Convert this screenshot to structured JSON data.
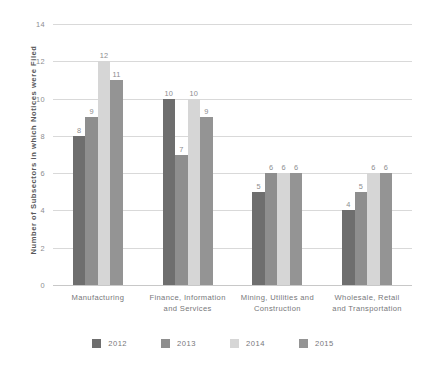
{
  "chart_data": {
    "type": "bar",
    "title": "",
    "subtitle": "",
    "xlabel": "",
    "ylabel": "Number of Subsectors in which Notices were Filed",
    "ylim": [
      0,
      14
    ],
    "y_ticks": [
      0,
      2,
      4,
      6,
      8,
      10,
      12,
      14
    ],
    "grid": "horizontal",
    "legend_position": "bottom-center",
    "show_value_labels": true,
    "categories": [
      "Manufacturing",
      "Finance, Information and Services",
      "Mining, Utilities and Construction",
      "Wholesale, Retail and Transportation"
    ],
    "series": [
      {
        "name": "2012",
        "color": "#6e6e6e",
        "values": [
          8,
          10,
          5,
          4
        ]
      },
      {
        "name": "2013",
        "color": "#8e8e8e",
        "values": [
          9,
          7,
          6,
          5
        ]
      },
      {
        "name": "2014",
        "color": "#d6d6d6",
        "values": [
          12,
          10,
          6,
          6
        ]
      },
      {
        "name": "2015",
        "color": "#949494",
        "values": [
          11,
          9,
          6,
          6
        ]
      }
    ]
  },
  "axis": {
    "y_title": "Number of Subsectors in which Notices were Filed",
    "tick_labels": [
      "14",
      "12",
      "10",
      "8",
      "6",
      "4",
      "2",
      "0"
    ]
  },
  "categories_display": [
    [
      "Manufacturing"
    ],
    [
      "Finance, Information",
      "and Services"
    ],
    [
      "Mining, Utilities and",
      "Construction"
    ],
    [
      "Wholesale, Retail",
      "and Transportation"
    ]
  ],
  "legend": {
    "items": [
      {
        "label": "2012",
        "color": "#6e6e6e"
      },
      {
        "label": "2013",
        "color": "#8e8e8e"
      },
      {
        "label": "2014",
        "color": "#d6d6d6"
      },
      {
        "label": "2015",
        "color": "#949494"
      }
    ]
  },
  "colors": {
    "background": "#ffffff",
    "gridline": "#d9d9d9",
    "baseline": "#c8c8c8",
    "tick_text": "#8d8d8f",
    "category_text": "#77777a",
    "axis_title_text": "#58585a",
    "value_label_text": "#8d8d8f"
  }
}
